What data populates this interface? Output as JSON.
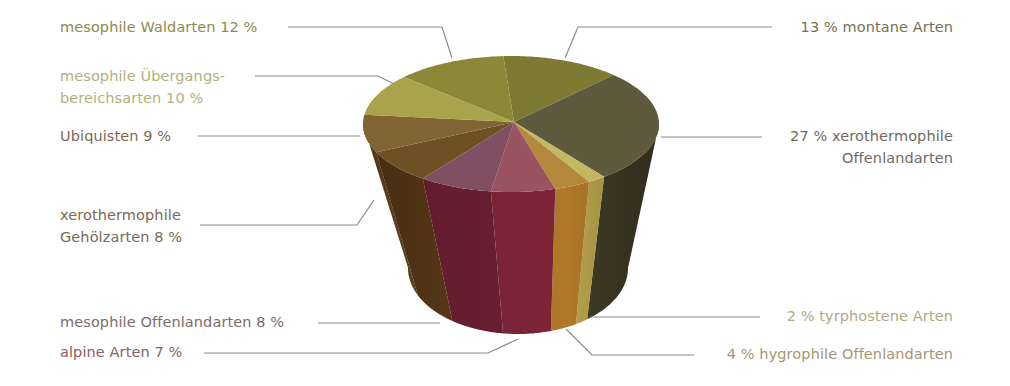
{
  "chart_data": {
    "type": "pie",
    "style": "3d-cylinder",
    "title": "",
    "legend": "callout labels with leader lines",
    "slices": [
      {
        "label": "montane Arten",
        "value": 13,
        "display": "13 %  montane Arten",
        "top_color": "#7f7a32",
        "side_color": "#5e5a26"
      },
      {
        "label": "xerothermophile Offenlandarten",
        "value": 27,
        "display_line1": "27 %  xerothermophile",
        "display_line2": "Offenlandarten",
        "top_color": "#5e5a3e",
        "side_color": "#3f3c26"
      },
      {
        "label": "tyrphostene Arten",
        "value": 2,
        "display": "2 %  tyrphostene Arten",
        "top_color": "#c2b862",
        "side_color": "#b5a24a"
      },
      {
        "label": "hygrophile Offenlandarten",
        "value": 4,
        "display": "4 %  hygrophile Offenlandarten",
        "top_color": "#b4893e",
        "side_color": "#b07828"
      },
      {
        "label": "alpine Arten",
        "value": 7,
        "display": "alpine Arten  7 %",
        "top_color": "#9a5360",
        "side_color": "#7e2538"
      },
      {
        "label": "mesophile Offenlandarten",
        "value": 8,
        "display": "mesophile Offenlandarten  8 %",
        "top_color": "#805062",
        "side_color": "#6c1f32"
      },
      {
        "label": "xerothermophile Gehölzarten",
        "value": 8,
        "display_line1": "xerothermophile",
        "display_line2": "Gehölzarten  8 %",
        "top_color": "#6e5024",
        "side_color": "#5a3a18"
      },
      {
        "label": "Ubiquisten",
        "value": 9,
        "display": "Ubiquisten  9 %",
        "top_color": "#806434",
        "side_color": "#6a4a20"
      },
      {
        "label": "mesophile Übergangsbereichsarten",
        "value": 10,
        "display_line1": "mesophile Übergangs-",
        "display_line2": "bereichsarten  10 %",
        "top_color": "#a9a44c",
        "side_color": "#8c8838"
      },
      {
        "label": "mesophile Waldarten",
        "value": 12,
        "display": "mesophile Waldarten  12 %",
        "top_color": "#8d8838",
        "side_color": "#6e6a2a"
      }
    ]
  },
  "labels": {
    "waldarten": "mesophile Waldarten  12 %",
    "uebergang_1": "mesophile Übergangs-",
    "uebergang_2": "bereichsarten  10 %",
    "ubiquisten": "Ubiquisten  9 %",
    "gehoelz_1": "xerothermophile",
    "gehoelz_2": "Gehölzarten  8 %",
    "meso_offen": "mesophile Offenlandarten  8 %",
    "alpine": "alpine Arten  7 %",
    "montane": "13 %  montane Arten",
    "xero_offen_1": "27 %  xerothermophile",
    "xero_offen_2": "Offenlandarten",
    "tyrpho": "2 %  tyrphostene Arten",
    "hygro": "4 %  hygrophile Offenlandarten"
  },
  "colors": {
    "label_olive": "#8f8a4c",
    "label_light_olive": "#b5b07a",
    "label_brown": "#7a6a50",
    "label_gray": "#6e6a62",
    "label_mauve": "#8a6060",
    "label_tan": "#b09a70",
    "leader_line": "#8a8a8a"
  }
}
